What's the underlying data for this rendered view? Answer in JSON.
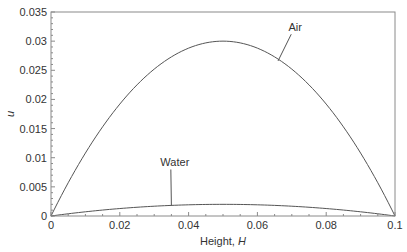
{
  "chart_data": {
    "type": "line",
    "title": "",
    "xlabel": "Height, H",
    "xlabel_main": "Height, ",
    "xlabel_var": "H",
    "ylabel": "u",
    "xlim": [
      0,
      0.1
    ],
    "ylim": [
      0,
      0.035
    ],
    "xticks": [
      0,
      0.02,
      0.04,
      0.06,
      0.08,
      0.1
    ],
    "xtick_labels": [
      "0",
      "0.02",
      "0.04",
      "0.06",
      "0.08",
      "0.1"
    ],
    "yticks": [
      0,
      0.005,
      0.01,
      0.015,
      0.02,
      0.025,
      0.03,
      0.035
    ],
    "ytick_labels": [
      "0",
      "0.005",
      "0.01",
      "0.015",
      "0.02",
      "0.025",
      "0.03",
      "0.035"
    ],
    "grid": false,
    "legend": "inline annotations",
    "series": [
      {
        "name": "Air",
        "shape": "parabola",
        "x": [
          0,
          0.01,
          0.02,
          0.03,
          0.04,
          0.05,
          0.06,
          0.07,
          0.08,
          0.09,
          0.1
        ],
        "values": [
          0,
          0.0108,
          0.0192,
          0.0252,
          0.0288,
          0.03,
          0.0288,
          0.0252,
          0.0192,
          0.0108,
          0
        ],
        "annotation": {
          "label": "Air",
          "x": 0.071,
          "y": 0.0317,
          "arrow_to_x": 0.066,
          "arrow_to_y": 0.0266
        }
      },
      {
        "name": "Water",
        "shape": "parabola",
        "x": [
          0,
          0.01,
          0.02,
          0.03,
          0.04,
          0.05,
          0.06,
          0.07,
          0.08,
          0.09,
          0.1
        ],
        "values": [
          0,
          0.00072,
          0.00128,
          0.00168,
          0.00192,
          0.002,
          0.00192,
          0.00168,
          0.00128,
          0.00072,
          0
        ],
        "annotation": {
          "label": "Water",
          "x": 0.036,
          "y": 0.0085,
          "arrow_to_x": 0.035,
          "arrow_to_y": 0.00175
        }
      }
    ]
  }
}
